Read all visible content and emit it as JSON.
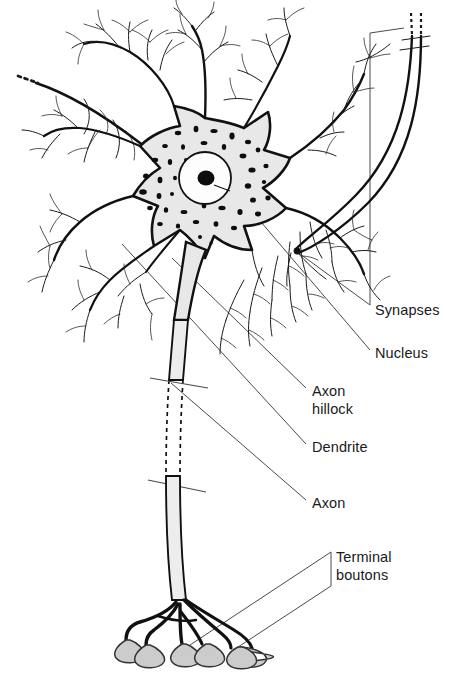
{
  "figure": {
    "background_color": "#ffffff",
    "ink_color": "#111111",
    "cytoplasm_color": "#e8e8e8",
    "bouton_fill_color": "#cccccc",
    "leader_line_color": "#4a4a4a",
    "label_text_color": "#1a1a1a"
  },
  "labels": [
    {
      "id": "synapses",
      "text": "Synapses",
      "x": 375,
      "y": 315
    },
    {
      "id": "nucleus",
      "text": "Nucleus",
      "x": 375,
      "y": 358
    },
    {
      "id": "axon_hillock_line1",
      "text": "Axon",
      "x": 312,
      "y": 396
    },
    {
      "id": "axon_hillock_line2",
      "text": "hillock",
      "x": 312,
      "y": 414
    },
    {
      "id": "dendrite",
      "text": "Dendrite",
      "x": 312,
      "y": 452
    },
    {
      "id": "axon",
      "text": "Axon",
      "x": 312,
      "y": 508
    },
    {
      "id": "terminal_boutons_line1",
      "text": "Terminal",
      "x": 336,
      "y": 562
    },
    {
      "id": "terminal_boutons_line2",
      "text": "boutons",
      "x": 336,
      "y": 580
    }
  ],
  "structures": {
    "soma": {
      "label": "cell body",
      "center_x": 205,
      "center_y": 185
    },
    "nucleus": {
      "center_x": 205,
      "center_y": 178,
      "radius": 26
    },
    "nucleolus": {
      "center_x": 206,
      "center_y": 178,
      "radius": 8
    },
    "terminal_bouton_count": 6,
    "dendrite_trunk_count": 6,
    "incoming_axon_count": 3
  }
}
